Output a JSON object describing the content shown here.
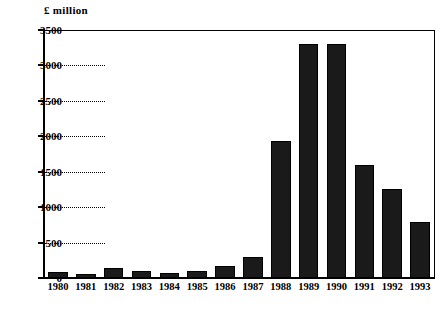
{
  "chart_data": {
    "type": "bar",
    "title": "",
    "subtitle": "",
    "xlabel": "",
    "ylabel": "£ million",
    "unit_caption": "£ million",
    "categories": [
      "1980",
      "1981",
      "1982",
      "1983",
      "1984",
      "1985",
      "1986",
      "1987",
      "1988",
      "1989",
      "1990",
      "1991",
      "1992",
      "1993"
    ],
    "values": [
      90,
      60,
      140,
      100,
      75,
      105,
      165,
      300,
      1930,
      3300,
      3300,
      1590,
      1260,
      790
    ],
    "series": [
      {
        "name": "£ million",
        "values": [
          90,
          60,
          140,
          100,
          75,
          105,
          165,
          300,
          1930,
          3300,
          3300,
          1590,
          1260,
          790
        ]
      }
    ],
    "ylim": [
      0,
      3500
    ],
    "ytick_values": [
      0,
      500,
      1000,
      1500,
      2000,
      2500,
      3000,
      3500
    ],
    "ytick_labels": [
      "0",
      "500",
      "1000",
      "1500",
      "2000",
      "2500",
      "3000",
      "3500"
    ],
    "grid": "horizontal-dotted-partial",
    "legend": "none",
    "legend_position": "none",
    "bar_color": "#1a1a1a",
    "axis_color": "#000000",
    "background_color": "#ffffff"
  }
}
